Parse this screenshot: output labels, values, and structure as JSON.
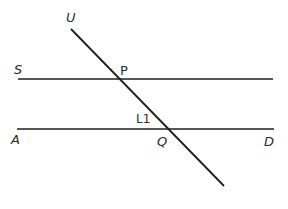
{
  "diagram": {
    "type": "parallel lines cut by a transversal",
    "colors": {
      "background": "#ffffff",
      "line": "#1e1e1e",
      "text": "#2a2a2a"
    },
    "lines": {
      "upper": {
        "name": "line SP",
        "x1": 18,
        "y1": 79,
        "x2": 273,
        "y2": 79
      },
      "lower": {
        "name": "line AD",
        "x1": 17,
        "y1": 129,
        "x2": 274,
        "y2": 129
      },
      "transversal": {
        "name": "line UQ",
        "x1": 71,
        "y1": 29,
        "x2": 224,
        "y2": 186
      }
    },
    "labels": {
      "U": "U",
      "S": "S",
      "P": "P",
      "angle": "L1",
      "Q": "Q",
      "A": "A",
      "D": "D"
    }
  }
}
